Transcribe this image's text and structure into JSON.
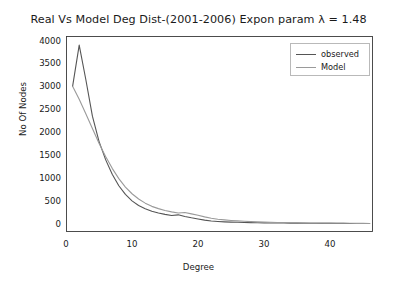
{
  "chart_data": {
    "type": "line",
    "title": "Real Vs Model Deg Dist-(2001-2006) Expon param λ = 1.48",
    "xlabel": "Degree",
    "ylabel": "No Of Nodes",
    "xlim": [
      0,
      46.5
    ],
    "ylim": [
      -180,
      4100
    ],
    "xticks": [
      0,
      10,
      20,
      30,
      40
    ],
    "xtick_labels": [
      "0",
      "10",
      "20",
      "30",
      "40"
    ],
    "yticks": [
      0,
      500,
      1000,
      1500,
      2000,
      2500,
      3000,
      3500,
      4000
    ],
    "ytick_labels": [
      "0",
      "500",
      "1000",
      "1500",
      "2000",
      "2500",
      "3000",
      "3500",
      "4000"
    ],
    "grid": false,
    "legend_position": "upper right",
    "legend_entries": [
      "observed",
      "Model"
    ],
    "x": [
      1,
      2,
      3,
      4,
      5,
      6,
      7,
      8,
      9,
      10,
      11,
      12,
      13,
      14,
      15,
      16,
      17,
      18,
      19,
      20,
      21,
      22,
      23,
      24,
      25,
      26,
      27,
      28,
      29,
      30,
      31,
      32,
      33,
      34,
      35,
      36,
      37,
      38,
      39,
      40,
      41,
      42,
      43,
      44,
      45,
      46
    ],
    "series": [
      {
        "name": "observed",
        "color": "#555555",
        "linewidth": 1.1,
        "values": [
          3000,
          3900,
          3150,
          2350,
          1800,
          1400,
          1080,
          830,
          640,
          500,
          400,
          330,
          275,
          235,
          205,
          180,
          195,
          160,
          130,
          105,
          80,
          60,
          50,
          42,
          36,
          32,
          28,
          25,
          22,
          20,
          18,
          16,
          15,
          14,
          13,
          12,
          11,
          10,
          9,
          9,
          8,
          8,
          7,
          7,
          6,
          6
        ]
      },
      {
        "name": "Model",
        "color": "#9a9a9a",
        "linewidth": 1.1,
        "values": [
          3000,
          2720,
          2400,
          2080,
          1760,
          1470,
          1210,
          985,
          800,
          655,
          540,
          450,
          380,
          330,
          290,
          260,
          235,
          245,
          215,
          185,
          150,
          120,
          100,
          85,
          72,
          62,
          54,
          47,
          41,
          36,
          32,
          29,
          26,
          23,
          21,
          19,
          17,
          16,
          14,
          13,
          12,
          11,
          10,
          9,
          8,
          7
        ]
      }
    ]
  },
  "figure": {
    "background": "#ffffff",
    "axes_edge_color": "#3a3a3a",
    "tick_color": "#3a3a3a",
    "text_color": "#1a1a1a",
    "legend_border_color": "#b9b9b9"
  }
}
